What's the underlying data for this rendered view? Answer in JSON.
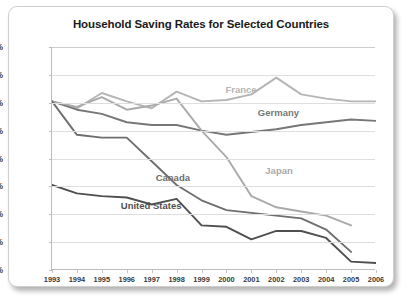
{
  "chart": {
    "title": "Household Saving Rates for Selected Countries"
  },
  "chart_data": {
    "type": "line",
    "title": "Household Saving Rates for Selected Countries",
    "xlabel": "",
    "ylabel": "",
    "x": [
      1993,
      1994,
      1995,
      1996,
      1997,
      1998,
      1999,
      2000,
      2001,
      2002,
      2003,
      2004,
      2005,
      2006
    ],
    "xtick_labels": [
      "1993",
      "1994",
      "1995",
      "1996",
      "1997",
      "1998",
      "1999",
      "2000",
      "2001",
      "2002",
      "2003",
      "2004",
      "2005",
      "2006"
    ],
    "ytick_labels": [
      "0%",
      "2%",
      "4%",
      "6%",
      "8%",
      "10%",
      "12%",
      "14%",
      "16%"
    ],
    "yticks": [
      0,
      2,
      4,
      6,
      8,
      10,
      12,
      14,
      16
    ],
    "ylim": [
      0,
      16
    ],
    "xlim": [
      1993,
      2006
    ],
    "grid": true,
    "legend": "inline-labels",
    "series": [
      {
        "name": "France",
        "color": "#b5b5b5",
        "label_x": 2000.0,
        "label_y": 12.9,
        "values": [
          12.1,
          11.6,
          12.7,
          12.1,
          11.6,
          12.8,
          12.1,
          12.2,
          12.6,
          13.8,
          12.6,
          12.3,
          12.1,
          12.1
        ]
      },
      {
        "name": "Germany",
        "color": "#777777",
        "label_x": 2001.3,
        "label_y": 11.3,
        "values": [
          12.1,
          11.5,
          11.2,
          10.6,
          10.4,
          10.4,
          10.0,
          9.7,
          9.9,
          10.1,
          10.4,
          10.6,
          10.8,
          10.7
        ]
      },
      {
        "name": "Japan",
        "color": "#aaaaaa",
        "label_x": 2001.6,
        "label_y": 7.1,
        "values": [
          12.1,
          11.7,
          12.4,
          11.5,
          11.8,
          12.3,
          10.0,
          8.1,
          5.3,
          4.5,
          4.2,
          3.9,
          3.2,
          null
        ]
      },
      {
        "name": "Canada",
        "color": "#6e6e6e",
        "label_x": 1997.2,
        "label_y": 6.6,
        "values": [
          12.1,
          9.7,
          9.5,
          9.5,
          7.8,
          6.1,
          5.0,
          4.3,
          4.1,
          3.9,
          3.7,
          2.9,
          1.3,
          null
        ]
      },
      {
        "name": "United States",
        "color": "#4f4f4f",
        "label_x": 1995.8,
        "label_y": 4.6,
        "values": [
          6.1,
          5.5,
          5.3,
          5.2,
          4.7,
          5.1,
          3.2,
          3.1,
          2.2,
          2.8,
          2.8,
          2.3,
          0.6,
          0.5
        ]
      }
    ]
  }
}
